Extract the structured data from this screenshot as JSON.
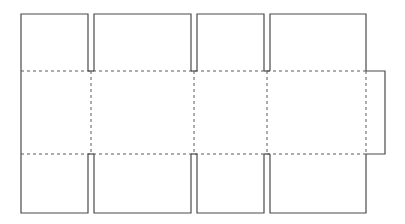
{
  "diagram": {
    "title": "Box net (die-cut template)",
    "legend": {
      "cut_line": "solid line = cut",
      "fold_line": "dashed line = fold"
    },
    "colors": {
      "background": "#ffffff",
      "cut_stroke": "#4a4a4a",
      "fold_stroke": "#5a5a5a"
    },
    "geometry": {
      "fold_top_y": 71,
      "fold_bottom_y": 154,
      "top_flap_y": 14,
      "bottom_flap_y": 213,
      "panel_edges_x": [
        21,
        91,
        194,
        267,
        366
      ],
      "glue_tab_right_x": 385,
      "notch_gap": 3
    },
    "panels": [
      {
        "name": "panel-1",
        "x0": 21,
        "x1": 91
      },
      {
        "name": "panel-2",
        "x0": 91,
        "x1": 194
      },
      {
        "name": "panel-3",
        "x0": 194,
        "x1": 267
      },
      {
        "name": "panel-4",
        "x0": 267,
        "x1": 366
      }
    ],
    "glue_tab": {
      "name": "glue-tab",
      "x0": 366,
      "x1": 385,
      "y0": 71,
      "y1": 154
    }
  }
}
